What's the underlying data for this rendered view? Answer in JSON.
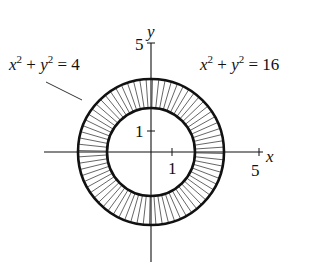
{
  "diagram": {
    "type": "annulus-region",
    "center": [
      0,
      0
    ],
    "inner_circle": {
      "equation_lhs": "x",
      "equation_mid": "y",
      "equation_rhs": "4",
      "radius": 2
    },
    "outer_circle": {
      "equation_lhs": "x",
      "equation_mid": "y",
      "equation_rhs": "16",
      "radius": 4
    },
    "shading": "radial hatching between circles",
    "axes": {
      "x_label": "x",
      "y_label": "y",
      "x_tick_1": "1",
      "x_tick_5": "5",
      "y_tick_1": "1",
      "y_tick_5": "5"
    },
    "labels": {
      "inner": {
        "a": "x",
        "plus": " + ",
        "b": "y",
        "eq": " = ",
        "val": "4",
        "exp": "2"
      },
      "outer": {
        "a": "x",
        "plus": " + ",
        "b": "y",
        "eq": " = ",
        "val": "16",
        "exp": "2"
      }
    },
    "colors": {
      "stroke": "#111111",
      "hatch": "#555555",
      "background": "#ffffff"
    }
  }
}
